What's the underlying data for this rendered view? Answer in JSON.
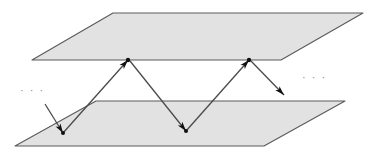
{
  "figure": {
    "background_color": "#ffffff",
    "width": 375,
    "height": 159
  },
  "style": {
    "plane_fill": "#e2e2e2",
    "plane_stroke": "#5a5a5a",
    "plane_stroke_width": 1.1,
    "ray_stroke": "#4a4a4a",
    "ray_stroke_width": 1.3,
    "arrow_fill": "#111111",
    "vertex_fill": "#111111",
    "ellipsis_color": "#8d8d8d"
  },
  "planes": [
    {
      "name": "top-plane",
      "label": "upper plane",
      "points": "113,13 363,13 281,60 32,60"
    },
    {
      "name": "bottom-plane",
      "label": "lower plane",
      "points": "96,101 345,101 264,146 15,146"
    }
  ],
  "rays": [
    {
      "name": "incoming-ray",
      "label": "incoming ray",
      "path": "45,104 63,133",
      "arrowhead": {
        "x": 63,
        "y": 133,
        "angle": 58
      }
    },
    {
      "name": "ray-segment-1",
      "label": "reflection 1 (lower to upper)",
      "path": "63,133 128,60",
      "arrowhead": {
        "x": 128,
        "y": 60,
        "angle": -48
      }
    },
    {
      "name": "ray-segment-2",
      "label": "reflection 2 (upper to lower)",
      "path": "130,61 186,131",
      "arrowhead": {
        "x": 186,
        "y": 131,
        "angle": 51
      }
    },
    {
      "name": "ray-segment-3",
      "label": "reflection 3 (lower to upper)",
      "path": "186,131 249,60",
      "arrowhead": {
        "x": 249,
        "y": 60,
        "angle": -48
      }
    },
    {
      "name": "outgoing-ray",
      "label": "outgoing ray",
      "path": "251,61 284,95",
      "arrowhead": {
        "x": 284,
        "y": 95,
        "angle": 46
      }
    }
  ],
  "vertices": [
    {
      "name": "bounce-point-upper-1",
      "x": 128,
      "y": 60,
      "r": 2.2
    },
    {
      "name": "bounce-point-upper-2",
      "x": 249,
      "y": 60,
      "r": 2.2
    },
    {
      "name": "bounce-point-lower-1",
      "x": 63,
      "y": 133,
      "r": 2.0
    },
    {
      "name": "bounce-point-lower-2",
      "x": 186,
      "y": 131,
      "r": 2.0
    }
  ],
  "annotations": {
    "ellipsis_left": "· · ·",
    "ellipsis_right": "· · ·"
  }
}
